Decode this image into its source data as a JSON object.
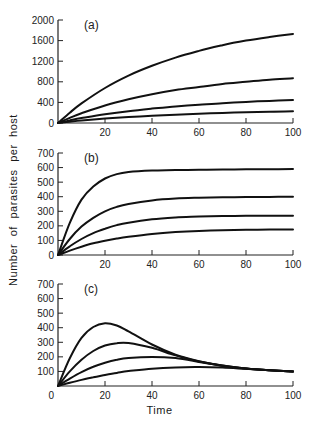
{
  "figure": {
    "ylabel": "Number of parasites per host",
    "xlabel": "Time"
  },
  "chart_data": [
    {
      "type": "line",
      "panel_label": "(a)",
      "title": "(a)",
      "xlabel": "Time",
      "ylabel": "Number of parasites per host",
      "xlim": [
        0,
        100
      ],
      "ylim": [
        0,
        2000
      ],
      "xticks": [
        20,
        40,
        60,
        80,
        100
      ],
      "yticks": [
        0,
        400,
        800,
        1200,
        1600,
        2000
      ],
      "grid": false,
      "x": [
        0,
        5,
        10,
        20,
        30,
        40,
        50,
        60,
        70,
        80,
        90,
        100
      ],
      "series": [
        {
          "name": "curve 1",
          "values": [
            0,
            200,
            380,
            680,
            920,
            1110,
            1270,
            1400,
            1510,
            1600,
            1670,
            1730
          ]
        },
        {
          "name": "curve 2",
          "values": [
            0,
            100,
            190,
            340,
            460,
            560,
            640,
            700,
            760,
            800,
            840,
            870
          ]
        },
        {
          "name": "curve 3",
          "values": [
            0,
            50,
            95,
            170,
            230,
            280,
            320,
            355,
            385,
            410,
            430,
            445
          ]
        },
        {
          "name": "curve 4",
          "values": [
            0,
            25,
            48,
            85,
            115,
            140,
            160,
            180,
            195,
            210,
            220,
            230
          ]
        }
      ]
    },
    {
      "type": "line",
      "panel_label": "(b)",
      "title": "(b)",
      "xlabel": "Time",
      "ylabel": "Number of parasites per host",
      "xlim": [
        0,
        100
      ],
      "ylim": [
        0,
        700
      ],
      "xticks": [
        20,
        40,
        60,
        80,
        100
      ],
      "yticks": [
        0,
        100,
        200,
        300,
        400,
        500,
        600,
        700
      ],
      "grid": false,
      "x": [
        0,
        5,
        10,
        15,
        20,
        25,
        30,
        40,
        50,
        60,
        70,
        80,
        90,
        100
      ],
      "series": [
        {
          "name": "curve 1",
          "values": [
            0,
            220,
            380,
            470,
            525,
            555,
            570,
            580,
            583,
            585,
            587,
            588,
            589,
            590
          ]
        },
        {
          "name": "curve 2",
          "values": [
            0,
            110,
            195,
            255,
            300,
            330,
            350,
            375,
            388,
            393,
            396,
            398,
            399,
            400
          ]
        },
        {
          "name": "curve 3",
          "values": [
            0,
            60,
            110,
            150,
            180,
            205,
            222,
            245,
            258,
            264,
            267,
            269,
            270,
            270
          ]
        },
        {
          "name": "curve 4",
          "values": [
            0,
            30,
            57,
            80,
            98,
            113,
            125,
            145,
            158,
            165,
            170,
            173,
            174,
            175
          ]
        }
      ]
    },
    {
      "type": "line",
      "panel_label": "(c)",
      "title": "(c)",
      "xlabel": "Time",
      "ylabel": "Number of parasites per host",
      "xlim": [
        0,
        100
      ],
      "ylim": [
        0,
        700
      ],
      "xticks": [
        20,
        40,
        60,
        80,
        100
      ],
      "yticks": [
        100,
        200,
        300,
        400,
        500,
        600,
        700
      ],
      "xtick_zero_label": "0",
      "grid": false,
      "x": [
        0,
        5,
        10,
        15,
        20,
        25,
        30,
        40,
        50,
        60,
        70,
        80,
        90,
        100
      ],
      "series": [
        {
          "name": "curve 1",
          "values": [
            0,
            190,
            330,
            405,
            430,
            415,
            375,
            285,
            215,
            170,
            140,
            120,
            108,
            100
          ]
        },
        {
          "name": "curve 2",
          "values": [
            0,
            100,
            180,
            240,
            278,
            294,
            295,
            262,
            210,
            168,
            140,
            120,
            108,
            100
          ]
        },
        {
          "name": "curve 3",
          "values": [
            0,
            50,
            95,
            132,
            160,
            180,
            192,
            200,
            192,
            165,
            138,
            120,
            108,
            100
          ]
        },
        {
          "name": "curve 4",
          "values": [
            0,
            22,
            42,
            60,
            76,
            90,
            102,
            118,
            127,
            130,
            126,
            118,
            108,
            100
          ]
        }
      ]
    }
  ]
}
